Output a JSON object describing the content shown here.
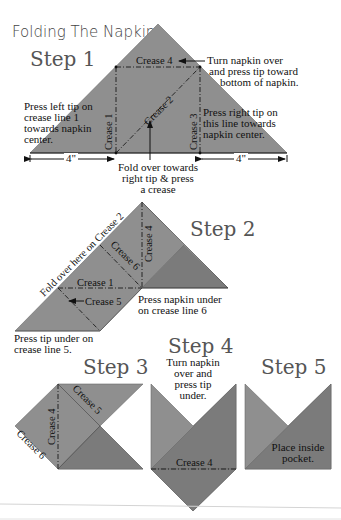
{
  "title": "Folding The Napkin",
  "colors": {
    "napkin": "#8f8f8f",
    "napkin_dark": "#7b7b7b",
    "line": "#1a1a1a",
    "background": "#ffffff"
  },
  "steps": [
    {
      "label": "Step 1",
      "creases": [
        "Crease 4",
        "Crease 2",
        "Crease 1",
        "Crease 3"
      ],
      "notes": {
        "top_right": [
          "Turn napkin over",
          "and press tip toward",
          "bottom of napkin."
        ],
        "left": [
          "Press left tip on",
          "crease line 1",
          "towards napkin",
          "center."
        ],
        "right": [
          "Press right tip on",
          "this line towards",
          "napkin center."
        ],
        "bottom": [
          "Fold over towards",
          "right tip & press",
          "a crease"
        ]
      },
      "measurements": {
        "left": "4\"",
        "right": "4\""
      }
    },
    {
      "label": "Step 2",
      "creases": [
        "Crease 4",
        "Crease 6",
        "Crease 1",
        "Crease 5"
      ],
      "notes": {
        "diagonal": "Fold over here on Crease 2",
        "right": [
          "Press napkin under",
          "on crease line 6"
        ],
        "bottom": [
          "Press tip under on",
          "crease line 5."
        ]
      }
    },
    {
      "label": "Step 3",
      "creases": [
        "Crease 4",
        "Crease 5",
        "Crease 6"
      ]
    },
    {
      "label": "Step 4",
      "creases": [
        "Crease 4"
      ],
      "notes": {
        "top": [
          "Turn napkin",
          "over and",
          "press tip",
          "under."
        ]
      }
    },
    {
      "label": "Step 5",
      "notes": {
        "center": [
          "Place inside",
          "pocket."
        ]
      }
    }
  ]
}
